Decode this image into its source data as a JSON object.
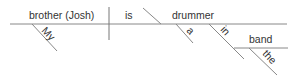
{
  "diagram": {
    "type": "sentence-diagram",
    "sentence": "My brother (Josh) is a drummer in the band",
    "subject": "brother (Josh)",
    "verb": "is",
    "predicate_nominative": "drummer",
    "modifiers": {
      "subject_modifier": "My",
      "predicate_modifier": "a",
      "preposition": "in",
      "prepositional_object": "band",
      "object_modifier": "the"
    },
    "colors": {
      "line": "#888888",
      "text": "#333333",
      "background": "#ffffff"
    }
  }
}
